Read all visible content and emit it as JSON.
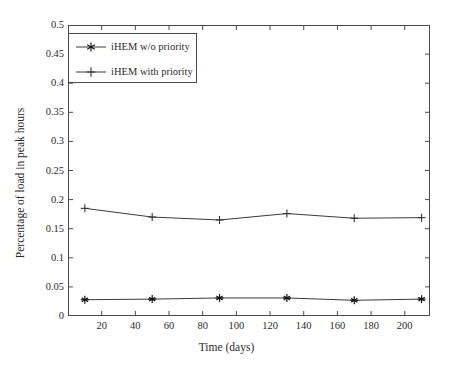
{
  "chart_data": {
    "type": "line",
    "title": "",
    "xlabel": "Time (days)",
    "ylabel": "Percentage of load in peak hours",
    "xlim": [
      0,
      215
    ],
    "ylim": [
      0,
      0.5
    ],
    "xticks": [
      20,
      40,
      60,
      80,
      100,
      120,
      140,
      160,
      180,
      200
    ],
    "xtick_labels": [
      "20",
      "40",
      "60",
      "80",
      "100",
      "120",
      "140",
      "160",
      "180",
      "200"
    ],
    "yticks": [
      0,
      0.05,
      0.1,
      0.15,
      0.2,
      0.25,
      0.3,
      0.35,
      0.4,
      0.45,
      0.5
    ],
    "ytick_labels": [
      "0",
      "0.05",
      "0.1",
      "0.15",
      "0.2",
      "0.25",
      "0.3",
      "0.35",
      "0.4",
      "0.45",
      "0.5"
    ],
    "grid": false,
    "legend_position": "upper left",
    "x": [
      10,
      50,
      90,
      130,
      170,
      210
    ],
    "series": [
      {
        "name": "iHEM w/o priority",
        "marker": "star",
        "color": "#3a3a3a",
        "values": [
          0.028,
          0.029,
          0.031,
          0.031,
          0.027,
          0.029
        ]
      },
      {
        "name": "iHEM with priority",
        "marker": "plus",
        "color": "#3a3a3a",
        "values": [
          0.185,
          0.17,
          0.165,
          0.176,
          0.168,
          0.169
        ]
      }
    ]
  },
  "legend": {
    "entries": [
      {
        "label": "iHEM w/o priority"
      },
      {
        "label": "iHEM with priority"
      }
    ]
  },
  "axes": {
    "x_title": "Time (days)",
    "y_title": "Percentage of load in peak hours"
  }
}
